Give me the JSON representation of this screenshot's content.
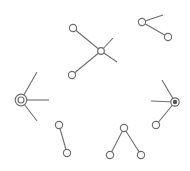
{
  "diagram": {
    "type": "node-link fragments",
    "stroke_color": "#6e6e6e",
    "background": "#ffffff",
    "groups": [
      {
        "id": "center-star",
        "nodes": [
          {
            "id": "a1",
            "x": 73,
            "y": 28,
            "style": "open"
          },
          {
            "id": "a2",
            "x": 101,
            "y": 51,
            "style": "open-small"
          },
          {
            "id": "a3",
            "x": 72,
            "y": 75,
            "style": "open"
          }
        ],
        "edges": [
          {
            "x1": 73,
            "y1": 28,
            "x2": 101,
            "y2": 51
          },
          {
            "x1": 72,
            "y1": 75,
            "x2": 101,
            "y2": 51
          },
          {
            "x1": 101,
            "y1": 51,
            "x2": 113,
            "y2": 38
          },
          {
            "x1": 101,
            "y1": 51,
            "x2": 117,
            "y2": 62
          }
        ]
      },
      {
        "id": "top-right-pair",
        "nodes": [
          {
            "id": "b1",
            "x": 142,
            "y": 22,
            "style": "open"
          },
          {
            "id": "b2",
            "x": 168,
            "y": 37,
            "style": "open"
          }
        ],
        "edges": [
          {
            "x1": 142,
            "y1": 22,
            "x2": 163,
            "y2": 15
          },
          {
            "x1": 142,
            "y1": 22,
            "x2": 168,
            "y2": 37
          }
        ]
      },
      {
        "id": "left-hub",
        "nodes": [
          {
            "id": "c1",
            "x": 21,
            "y": 100,
            "style": "double-ring"
          }
        ],
        "edges": [
          {
            "x1": 21,
            "y1": 100,
            "x2": 37,
            "y2": 72
          },
          {
            "x1": 21,
            "y1": 100,
            "x2": 49,
            "y2": 100
          },
          {
            "x1": 21,
            "y1": 100,
            "x2": 37,
            "y2": 121
          }
        ]
      },
      {
        "id": "right-hub",
        "nodes": [
          {
            "id": "d1",
            "x": 175,
            "y": 102,
            "style": "filled-ring"
          },
          {
            "id": "d2",
            "x": 156,
            "y": 125,
            "style": "open"
          }
        ],
        "edges": [
          {
            "x1": 175,
            "y1": 102,
            "x2": 162,
            "y2": 80
          },
          {
            "x1": 175,
            "y1": 102,
            "x2": 151,
            "y2": 101
          },
          {
            "x1": 175,
            "y1": 102,
            "x2": 156,
            "y2": 125
          }
        ]
      },
      {
        "id": "bottom-left-pair",
        "nodes": [
          {
            "id": "e1",
            "x": 59,
            "y": 125,
            "style": "open"
          },
          {
            "id": "e2",
            "x": 67,
            "y": 153,
            "style": "open"
          }
        ],
        "edges": [
          {
            "x1": 59,
            "y1": 125,
            "x2": 67,
            "y2": 153
          }
        ]
      },
      {
        "id": "bottom-tree",
        "nodes": [
          {
            "id": "f1",
            "x": 124,
            "y": 128,
            "style": "open"
          },
          {
            "id": "f2",
            "x": 110,
            "y": 155,
            "style": "open"
          },
          {
            "id": "f3",
            "x": 141,
            "y": 155,
            "style": "open"
          }
        ],
        "edges": [
          {
            "x1": 124,
            "y1": 128,
            "x2": 110,
            "y2": 155
          },
          {
            "x1": 124,
            "y1": 128,
            "x2": 141,
            "y2": 155
          }
        ]
      }
    ]
  }
}
